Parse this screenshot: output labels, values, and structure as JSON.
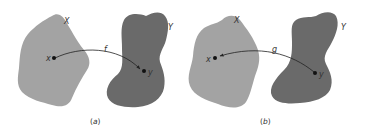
{
  "colors": {
    "domain_fill": "#a3a3a3",
    "codomain_fill": "#6a6a6a",
    "arrow": "#222222",
    "text": "#333333",
    "background": "#ffffff"
  },
  "panels": [
    {
      "id": "a",
      "caption_open": "(",
      "caption_letter": "a",
      "caption_close": ")",
      "set_x_label": "X",
      "set_y_label": "Y",
      "point_x_label": "x",
      "point_y_label": "y",
      "map_label": "f",
      "arrow_direction": "x-to-y"
    },
    {
      "id": "b",
      "caption_open": "(",
      "caption_letter": "b",
      "caption_close": ")",
      "set_x_label": "X",
      "set_y_label": "Y",
      "point_x_label": "x",
      "point_y_label": "y",
      "map_label": "g",
      "arrow_direction": "y-to-x"
    }
  ]
}
